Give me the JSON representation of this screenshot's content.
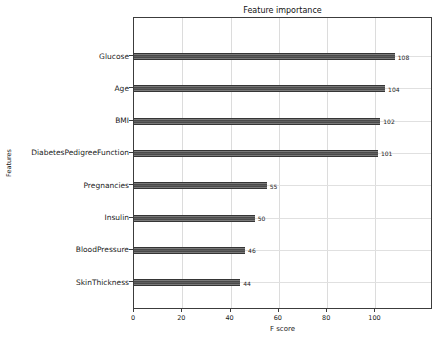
{
  "figure": {
    "title": "Feature importance",
    "xlabel": "F score",
    "ylabel": "Features"
  },
  "chart_data": {
    "type": "bar",
    "orientation": "horizontal",
    "title": "Feature importance",
    "xlabel": "F score",
    "ylabel": "Features",
    "categories": [
      "Glucose",
      "Age",
      "BMI",
      "DiabetesPedigreeFunction",
      "Pregnancies",
      "Insulin",
      "BloodPressure",
      "SkinThickness"
    ],
    "values": [
      108,
      104,
      102,
      101,
      55,
      50,
      46,
      44
    ],
    "value_labels": [
      "108",
      "104",
      "102",
      "101",
      "55",
      "50",
      "46",
      "44"
    ],
    "xlim": [
      0,
      123
    ],
    "xticks": [
      0,
      20,
      40,
      60,
      80,
      100
    ],
    "grid": true,
    "legend": "none",
    "bar_color": "#4a4a4a",
    "gridline_color": "#dcdcdc",
    "background_color": "#ffffff"
  }
}
